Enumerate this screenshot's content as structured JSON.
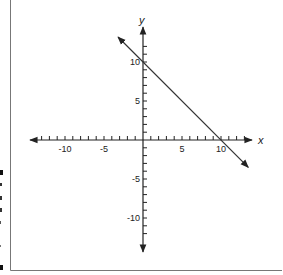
{
  "chart_data": {
    "type": "line",
    "title": "",
    "xlabel": "x",
    "ylabel": "y",
    "xlim": [
      -13,
      13
    ],
    "ylim": [
      -13,
      13
    ],
    "grid": false,
    "legend": null,
    "x_tick_labels": [
      "-10",
      "-5",
      "5",
      "10"
    ],
    "y_tick_labels": [
      "10",
      "5",
      "-5",
      "-10"
    ],
    "tick_step": 1,
    "series": [
      {
        "name": "line",
        "equation": "y = -x + 10",
        "slope": -1,
        "y_intercept": 10,
        "x_intercept": 10,
        "points": [
          [
            -3.2,
            13.2
          ],
          [
            0,
            10
          ],
          [
            10,
            0
          ],
          [
            13.5,
            -3.5
          ]
        ],
        "arrows": "both"
      }
    ]
  },
  "colors": {
    "axis": "#222222",
    "line": "#333333",
    "frame": "#666666"
  }
}
